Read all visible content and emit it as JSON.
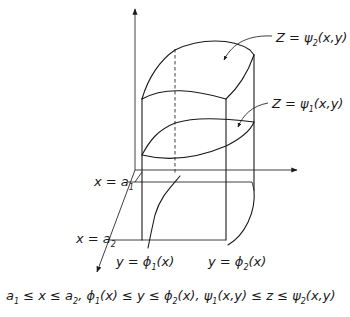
{
  "diagram": {
    "axes": {
      "z": {
        "label": ""
      },
      "y": {
        "label": ""
      },
      "x": {
        "label": ""
      }
    },
    "surfaces": {
      "upper": {
        "lhs": "Z = ",
        "fn": "ψ",
        "sub": "2",
        "args": "(x,y)"
      },
      "lower": {
        "lhs": "Z = ",
        "fn": "ψ",
        "sub": "1",
        "args": "(x,y)"
      }
    },
    "planes": {
      "a1": {
        "lhs": "x = a",
        "sub": "1"
      },
      "a2": {
        "lhs": "x = a",
        "sub": "2"
      }
    },
    "curves": {
      "phi1": {
        "lhs": "y = ",
        "fn": "ϕ",
        "sub": "1",
        "args": "(x)"
      },
      "phi2": {
        "lhs": "y = ",
        "fn": "ϕ",
        "sub": "2",
        "args": "(x)"
      }
    },
    "conditions": {
      "part1": "a",
      "part1_sub": "1",
      "part2": " ≤ x ≤ a",
      "part2_sub": "2",
      "part3": ",  ϕ",
      "part3_sub": "1",
      "part4": "(x) ≤ y ≤ ϕ",
      "part4_sub": "2",
      "part5": "(x),  ψ",
      "part5_sub": "1",
      "part6": "(x,y) ≤ z ≤ ψ",
      "part6_sub": "2",
      "part7": "(x,y)"
    },
    "colors": {
      "ink": "#1a1a1a",
      "background": "#ffffff"
    }
  }
}
